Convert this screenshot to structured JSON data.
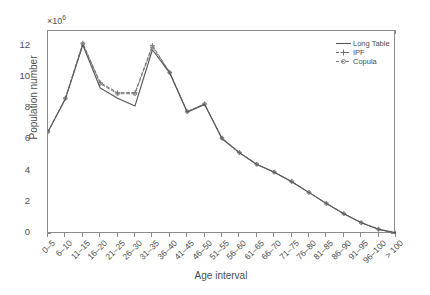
{
  "chart_data": {
    "type": "line",
    "title": "",
    "xlabel": "Age interval",
    "ylabel": "Population number",
    "y_exponent_label": "×10",
    "y_exponent_power": "6",
    "y_multiplier": 1000000,
    "ylim": [
      0,
      13
    ],
    "yticks": [
      0,
      2,
      4,
      6,
      8,
      10,
      12
    ],
    "ytick_labels": [
      "0",
      "2",
      "4",
      "6",
      "8",
      "10",
      "12"
    ],
    "grid": false,
    "legend_position": "top-right inside axes",
    "categories": [
      "0–5",
      "6–10",
      "11–15",
      "16–20",
      "21–25",
      "26–30",
      "31–35",
      "36–40",
      "41–45",
      "46–50",
      "51–55",
      "56–60",
      "61–65",
      "66–70",
      "71–75",
      "76–80",
      "81–85",
      "86–90",
      "91–95",
      "96–100",
      "> 100"
    ],
    "series": [
      {
        "name": "Long Table",
        "style": "solid",
        "marker": "none",
        "color": "#595959",
        "values": [
          6.55,
          8.65,
          12.1,
          9.35,
          8.7,
          8.2,
          11.8,
          10.3,
          7.8,
          8.3,
          6.1,
          5.2,
          4.45,
          3.95,
          3.35,
          2.65,
          1.95,
          1.3,
          0.72,
          0.3,
          0.07
        ]
      },
      {
        "name": "IPF",
        "style": "dashed",
        "marker": "plus",
        "color": "#6e6e6e",
        "values": [
          6.55,
          8.7,
          12.22,
          9.7,
          9.05,
          9.05,
          12.08,
          10.35,
          7.85,
          8.33,
          6.15,
          5.22,
          4.47,
          3.97,
          3.37,
          2.67,
          1.96,
          1.31,
          0.73,
          0.31,
          0.07
        ]
      },
      {
        "name": "Copula",
        "style": "dashed",
        "marker": "circle",
        "color": "#7d7d7d",
        "values": [
          6.55,
          8.68,
          12.18,
          9.62,
          8.98,
          8.98,
          11.98,
          10.33,
          7.83,
          8.32,
          6.13,
          5.21,
          4.46,
          3.96,
          3.36,
          2.66,
          1.95,
          1.3,
          0.72,
          0.3,
          0.07
        ]
      }
    ]
  },
  "axes": {
    "y_title": "Population number",
    "x_title": "Age interval"
  },
  "legend": {
    "items": [
      {
        "label": "Long Table"
      },
      {
        "label": "IPF"
      },
      {
        "label": "Copula"
      }
    ]
  },
  "colors": {
    "axis": "#8c8c8c",
    "text": "#4d4d4d",
    "long_table": "#595959",
    "ipf": "#6e6e6e",
    "copula": "#7d7d7d",
    "background": "#ffffff"
  }
}
